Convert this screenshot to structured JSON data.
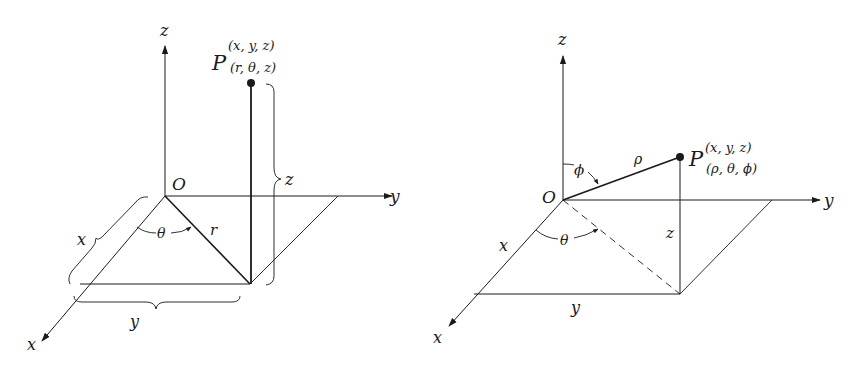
{
  "figures": [
    {
      "id": "cylindrical",
      "axes": {
        "x": "x",
        "y": "y",
        "z": "z"
      },
      "origin": "O",
      "point": {
        "name": "P",
        "cartesian": "(x, y, z)",
        "coords": "(r, θ, z)"
      },
      "labels": {
        "r": "r",
        "theta": "θ",
        "brace_x": "x",
        "brace_y": "y",
        "brace_z": "z"
      }
    },
    {
      "id": "spherical",
      "axes": {
        "x": "x",
        "y": "y",
        "z": "z"
      },
      "origin": "O",
      "point": {
        "name": "P",
        "cartesian": "(x, y, z)",
        "coords": "(ρ, θ, ϕ)"
      },
      "labels": {
        "rho": "ρ",
        "phi": "ϕ",
        "theta": "θ",
        "seg_x": "x",
        "seg_y": "y",
        "seg_z": "z"
      }
    }
  ],
  "colors": {
    "ink": "#1a1a1a",
    "background": "#ffffff"
  }
}
